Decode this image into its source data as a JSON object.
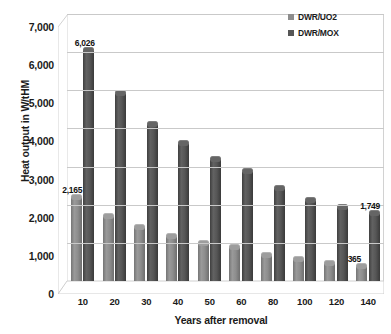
{
  "chart_data": {
    "type": "bar",
    "title": "",
    "xlabel": "Years after removal",
    "ylabel": "Heat output in W/tHM",
    "categories": [
      "10",
      "20",
      "30",
      "40",
      "50",
      "60",
      "80",
      "100",
      "120",
      "140"
    ],
    "ylim": [
      0,
      7000
    ],
    "y_ticks": [
      0,
      1000,
      2000,
      3000,
      4000,
      5000,
      6000,
      7000
    ],
    "y_tick_labels": [
      "0",
      "1,000",
      "2,000",
      "3,000",
      "4,000",
      "5,000",
      "6,000",
      "7,000"
    ],
    "grid": true,
    "legend_position": "top-right",
    "series": [
      {
        "name": "DWR/UO2",
        "color": "#8d8d8d",
        "values": [
          2165,
          1680,
          1380,
          1150,
          980,
          870,
          660,
          540,
          440,
          365
        ],
        "labels": [
          "2,165",
          "",
          "",
          "",
          "",
          "",
          "",
          "",
          "",
          "365"
        ]
      },
      {
        "name": "DWR/MOX",
        "color": "#565656",
        "values": [
          6026,
          4900,
          4100,
          3580,
          3180,
          2860,
          2400,
          2100,
          1920,
          1749
        ],
        "labels": [
          "6,026",
          "",
          "",
          "",
          "",
          "",
          "",
          "",
          "",
          "1,749"
        ]
      }
    ],
    "annotations": [
      {
        "text": "2,165",
        "series": "DWR/UO2",
        "category": "10"
      },
      {
        "text": "6,026",
        "series": "DWR/MOX",
        "category": "10"
      },
      {
        "text": "365",
        "series": "DWR/UO2",
        "category": "140"
      },
      {
        "text": "1,749",
        "series": "DWR/MOX",
        "category": "140"
      }
    ]
  }
}
